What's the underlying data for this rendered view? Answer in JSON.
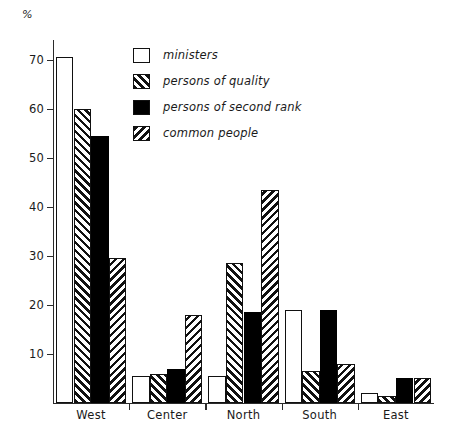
{
  "chart_data": {
    "type": "bar",
    "title": "",
    "xlabel": "",
    "ylabel": "%",
    "ylim": [
      0,
      74
    ],
    "yticks": [
      10,
      20,
      30,
      40,
      50,
      60,
      70
    ],
    "grid": false,
    "legend_position": "top-center-inside",
    "categories": [
      "West",
      "Center",
      "North",
      "South",
      "East"
    ],
    "series": [
      {
        "name": "ministers",
        "fill": "plain",
        "values": [
          70.5,
          5.5,
          5.5,
          19.0,
          2.0
        ]
      },
      {
        "name": "persons of quality",
        "fill": "fwd",
        "values": [
          60.0,
          6.0,
          28.5,
          6.5,
          1.5
        ]
      },
      {
        "name": "persons of second rank",
        "fill": "solid",
        "values": [
          54.5,
          7.0,
          18.5,
          19.0,
          5.0
        ]
      },
      {
        "name": "common people",
        "fill": "back",
        "values": [
          29.5,
          18.0,
          43.5,
          8.0,
          5.0
        ]
      }
    ]
  },
  "axis": {
    "unit_label": "%",
    "tick_labels": [
      "10",
      "20",
      "30",
      "40",
      "50",
      "60",
      "70"
    ]
  },
  "legend": {
    "items": [
      {
        "label": "ministers",
        "fill": "plain"
      },
      {
        "label": "persons of quality",
        "fill": "fwd"
      },
      {
        "label": "persons of second rank",
        "fill": "solid"
      },
      {
        "label": "common people",
        "fill": "back"
      }
    ]
  }
}
